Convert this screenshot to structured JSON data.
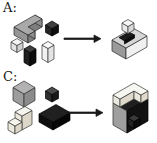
{
  "figure": {
    "panels": [
      {
        "label": "A:"
      },
      {
        "label": "C:"
      }
    ],
    "palette": {
      "gray_top": "#a9a9a9",
      "gray_side": "#8b8b8b",
      "black_block": "#111111",
      "white_block": "#f4f4f4",
      "cream_block": "#ece9dd",
      "arrow": "#1a1a1a",
      "background": "#ffffff"
    }
  },
  "shapes": {
    "pieces_a": [
      {
        "pts": "14,27 28,35 28,43 14,35",
        "fill": "#949494",
        "stroke": "#2a2a2a"
      },
      {
        "pts": "28,35 35,31 35,39 28,43",
        "fill": "#7e7e7e",
        "stroke": "#2a2a2a"
      },
      {
        "pts": "28,27 35,31 35,39 28,35",
        "fill": "#8d8d8d",
        "stroke": "#2a2a2a"
      },
      {
        "pts": "28,27 42,19 42,27 28,35",
        "fill": "#7e7e7e",
        "stroke": "#2a2a2a"
      },
      {
        "pts": "35,15 42,19 42,27 35,23",
        "fill": "#8d8d8d",
        "stroke": "#2a2a2a"
      },
      {
        "pts": "14,27 35,15 42,19 28,27 35,31 28,35",
        "fill": "#a9a9a9",
        "stroke": "#2a2a2a"
      },
      {
        "pts": "45.5,25 52,28.5 52,36 45.5,32.5",
        "fill": "#242424",
        "stroke": "#000000"
      },
      {
        "pts": "52,28.5 58.5,25 58.5,32.5 52,36",
        "fill": "#0f0f0f",
        "stroke": "#000000"
      },
      {
        "pts": "52,21 58.5,25 52,28.5 45.5,25",
        "fill": "#3f3f3f",
        "stroke": "#000000"
      },
      {
        "pts": "11,42 17,45.5 17,52.5 11,49",
        "fill": "#e3e3e3",
        "stroke": "#333333"
      },
      {
        "pts": "17,45.5 23,42 23,49 17,52.5",
        "fill": "#cfcfcf",
        "stroke": "#333333"
      },
      {
        "pts": "17,38.5 23,42 17,45.5 11,42",
        "fill": "#f4f4f4",
        "stroke": "#333333"
      },
      {
        "pts": "24,49 30,52.5 30,66 24,62.5",
        "fill": "#1f1f1f",
        "stroke": "#000000"
      },
      {
        "pts": "30,52.5 36,49 36,62.5 30,66",
        "fill": "#0d0d0d",
        "stroke": "#000000"
      },
      {
        "pts": "30,45.5 36,49 30,52.5 24,49",
        "fill": "#3f3f3f",
        "stroke": "#000000"
      },
      {
        "pts": "42,45 48,48.5 48,62.5 42,59",
        "fill": "#f1f1f1",
        "stroke": "#333333"
      },
      {
        "pts": "48,48.5 54,45 54,59 48,62.5",
        "fill": "#e4e4e4",
        "stroke": "#333333"
      },
      {
        "pts": "48,41.5 54,45 48,48.5 42,45",
        "fill": "#fbfbfb",
        "stroke": "#333333"
      }
    ],
    "result_a": [
      {
        "pts": "112,40 126,48 126,59 112,51",
        "fill": "#9a9a9a",
        "stroke": "#2a2a2a"
      },
      {
        "pts": "126,48 147,36 147,47 126,59",
        "fill": "#f0f0f0",
        "stroke": "#2a2a2a"
      },
      {
        "pts": "112,40 133,28 147,36 126,48",
        "fill": "#d6d6d6",
        "stroke": "#2a2a2a"
      },
      {
        "pts": "119,37.5 129,32 134.5,35 124.5,41",
        "fill": "#1b1b1b",
        "stroke": "#000000"
      },
      {
        "pts": "124.5,41 134.5,35 134.5,38 124.5,44",
        "fill": "#0c0c0c",
        "stroke": "#000000"
      },
      {
        "pts": "122,23 128,26.5 128,33.5 122,30",
        "fill": "#e9e9e9",
        "stroke": "#333333"
      },
      {
        "pts": "128,26.5 134,23 134,30 128,33.5",
        "fill": "#d7d7d7",
        "stroke": "#333333"
      },
      {
        "pts": "128,19.5 134,23 128,26.5 122,23",
        "fill": "#f6f6f6",
        "stroke": "#333333"
      }
    ],
    "pieces_c": [
      {
        "pts": "13,87.5 24,94 24,107 13,100.5",
        "fill": "#9d9d9d",
        "stroke": "#2f2f2f"
      },
      {
        "pts": "24,94 35,87.5 35,100.5 24,107",
        "fill": "#8b8b8b",
        "stroke": "#2f2f2f"
      },
      {
        "pts": "24,81 35,87.5 24,94 13,87.5",
        "fill": "#b2b2b2",
        "stroke": "#2f2f2f"
      },
      {
        "pts": "45.5,91 52,94.5 52,102 45.5,98.5",
        "fill": "#2e2e2e",
        "stroke": "#000000"
      },
      {
        "pts": "52,94.5 58.5,91 58.5,98.5 52,102",
        "fill": "#191919",
        "stroke": "#000000"
      },
      {
        "pts": "52,87 58.5,91 52,94.5 45.5,91",
        "fill": "#4a4a4a",
        "stroke": "#000000"
      },
      {
        "pts": "39,114 53,122 53,130 39,122",
        "fill": "#0e0e0e",
        "stroke": "#000000"
      },
      {
        "pts": "53,122 70,112.5 70,120.5 53,130",
        "fill": "#060606",
        "stroke": "#000000"
      },
      {
        "pts": "39,114 56,104.5 70,112.5 53,122",
        "fill": "#202020",
        "stroke": "#000000"
      },
      {
        "pts": "15,112 22,116 22,122 15,118",
        "fill": "#ebe8dc",
        "stroke": "#333333"
      },
      {
        "pts": "22,116 32,110.5 32,124.5 22,130",
        "fill": "#dcd7c8",
        "stroke": "#333333"
      },
      {
        "pts": "15,112 25,106.5 32,110.5 22,116",
        "fill": "#f5f4ed",
        "stroke": "#333333"
      },
      {
        "pts": "8,122 15,126 15,134 8,130",
        "fill": "#ebe8dc",
        "stroke": "#333333"
      },
      {
        "pts": "15,126 22,122 22,130 15,134",
        "fill": "#dcd7c8",
        "stroke": "#333333"
      },
      {
        "pts": "8,122 15,118 22,122 15,126",
        "fill": "#f5f4ed",
        "stroke": "#333333"
      }
    ],
    "result_c": [
      {
        "pts": "113,103 134,91 148,99 127,111",
        "fill": "#1f1f1f",
        "stroke": "#000000"
      },
      {
        "pts": "113,103 127,111 127,133 113,125",
        "fill": "#9f9f9f",
        "stroke": "#2a2a2a"
      },
      {
        "pts": "127,111 148,99 148,121 127,133",
        "fill": "#121212",
        "stroke": "#000000"
      },
      {
        "pts": "113,95 120,99 120,107 113,103",
        "fill": "#eae7dc",
        "stroke": "#333333"
      },
      {
        "pts": "120,99 134,91 134,99 120,107",
        "fill": "#ded9ca",
        "stroke": "#333333"
      },
      {
        "pts": "134,91 141,95 141,103 134,99",
        "fill": "#eae7dc",
        "stroke": "#333333"
      },
      {
        "pts": "141,95 148,91 148,99 141,103",
        "fill": "#ded9ca",
        "stroke": "#333333"
      },
      {
        "pts": "113,95 134,83 148,91 141,95 134,91 120,99",
        "fill": "#f7f7f2",
        "stroke": "#333333"
      },
      {
        "pts": "128,118 134,121.5 134,128.5 128,125",
        "fill": "#232323",
        "stroke": "#000000"
      },
      {
        "pts": "134,121.5 140,118 140,125 134,128.5",
        "fill": "#0d0d0d",
        "stroke": "#000000"
      },
      {
        "pts": "134,114.5 140,118 134,121.5 128,118",
        "fill": "#3a3a3a",
        "stroke": "#000000"
      }
    ],
    "arrow_a": [
      {
        "pts": "64,38 95,38 95,39.5 64,39.5",
        "fill": "#1a1a1a",
        "stroke": "#1a1a1a"
      },
      {
        "pts": "94,35 101,38.7 94,42.5",
        "fill": "#1a1a1a",
        "stroke": "#1a1a1a"
      }
    ],
    "arrow_c": [
      {
        "pts": "67,112 97,112 97,113.5 67,113.5",
        "fill": "#1a1a1a",
        "stroke": "#1a1a1a"
      },
      {
        "pts": "96,109 103,112.7 96,116.5",
        "fill": "#1a1a1a",
        "stroke": "#1a1a1a"
      }
    ]
  }
}
